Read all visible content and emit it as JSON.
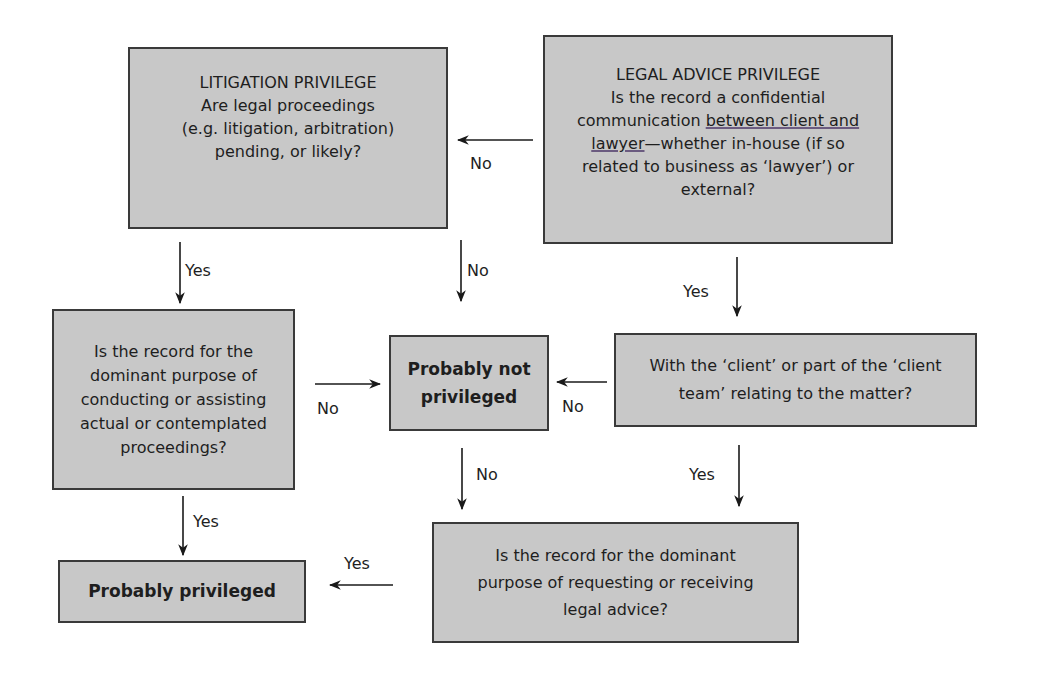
{
  "colors": {
    "box_fill": "#c8c8c8",
    "box_border": "#3a3a3a",
    "arrow": "#1a1a1a",
    "underline": "#6b5b80"
  },
  "nodes": {
    "litigation": {
      "title": "LITIGATION PRIVILEGE",
      "lines": [
        "Are legal proceedings",
        "(e.g. litigation, arbitration)",
        "pending, or likely?"
      ]
    },
    "legal_advice": {
      "title": "LEGAL ADVICE PRIVILEGE",
      "line1": "Is the record a confidential",
      "line2_pre": "communication ",
      "line2_underlined": "between client and",
      "line3_underlined": "lawyer",
      "line3_post": "—whether in-house (if so",
      "line4": "related to business as ‘lawyer’) or",
      "line5": "external?"
    },
    "dominant_purpose_proceedings": {
      "lines": [
        "Is the record for the",
        "dominant purpose of",
        "conducting or assisting",
        "actual or contemplated",
        "proceedings?"
      ]
    },
    "probably_not_privileged": {
      "lines": [
        "Probably not",
        "privileged"
      ]
    },
    "client_team": {
      "lines": [
        "With the ‘client’ or part of the ‘client",
        "team’ relating to the matter?"
      ]
    },
    "probably_privileged": {
      "label": "Probably privileged"
    },
    "dominant_purpose_advice": {
      "lines": [
        "Is the record for the dominant",
        "purpose of requesting or receiving",
        "legal advice?"
      ]
    }
  },
  "edges": {
    "legal_advice_to_litigation": "No",
    "litigation_to_dominant_proceedings": "Yes",
    "litigation_to_not_privileged": "No",
    "legal_advice_to_client_team": "Yes",
    "dominant_proceedings_to_not_privileged": "No",
    "client_team_to_not_privileged": "No",
    "dominant_proceedings_to_privileged": "Yes",
    "not_privileged_to_dominant_advice": "No",
    "client_team_to_dominant_advice": "Yes",
    "dominant_advice_to_privileged": "Yes"
  }
}
